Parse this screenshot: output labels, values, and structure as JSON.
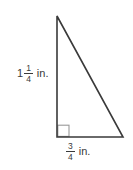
{
  "diagram": {
    "type": "right-triangle",
    "left_side": {
      "whole": "1",
      "numerator": "1",
      "denominator": "4",
      "unit": "in."
    },
    "bottom_side": {
      "numerator": "3",
      "denominator": "4",
      "unit": "in."
    },
    "colors": {
      "line": "#3a3a3a",
      "right_angle_marker": "#999999",
      "text": "#3a3a3a",
      "background": "#ffffff"
    }
  }
}
